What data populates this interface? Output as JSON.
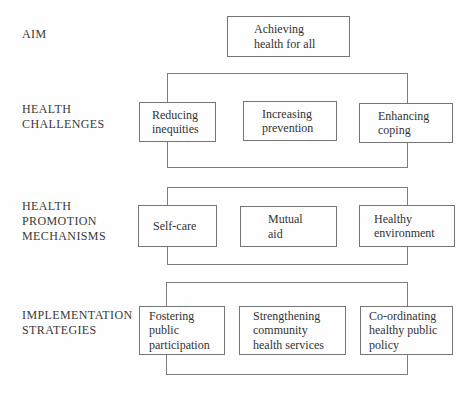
{
  "figure": {
    "background_color": "#fefefe",
    "line_color": "#7c7c7c",
    "text_color": "#333333",
    "rows": [
      {
        "id": "aim",
        "label_lines": [
          "AIM"
        ],
        "boxes": [
          {
            "lines": [
              "Achieving",
              "health for all"
            ]
          }
        ]
      },
      {
        "id": "health-challenges",
        "label_lines": [
          "HEALTH",
          "CHALLENGES"
        ],
        "boxes": [
          {
            "lines": [
              "Reducing",
              "inequities"
            ]
          },
          {
            "lines": [
              "Increasing",
              "prevention"
            ]
          },
          {
            "lines": [
              "Enhancing",
              "coping"
            ]
          }
        ]
      },
      {
        "id": "health-promotion-mechanisms",
        "label_lines": [
          "HEALTH",
          "PROMOTION",
          "MECHANISMS"
        ],
        "boxes": [
          {
            "lines": [
              "Self-care"
            ]
          },
          {
            "lines": [
              "Mutual",
              "aid"
            ]
          },
          {
            "lines": [
              "Healthy",
              "environment"
            ]
          }
        ]
      },
      {
        "id": "implementation-strategies",
        "label_lines": [
          "IMPLEMENTATION",
          "STRATEGIES"
        ],
        "boxes": [
          {
            "lines": [
              "Fostering",
              "public",
              "participation"
            ]
          },
          {
            "lines": [
              "Strengthening",
              "community",
              "health services"
            ]
          },
          {
            "lines": [
              "Co-ordinating",
              "healthy public",
              "policy"
            ]
          }
        ]
      }
    ]
  }
}
